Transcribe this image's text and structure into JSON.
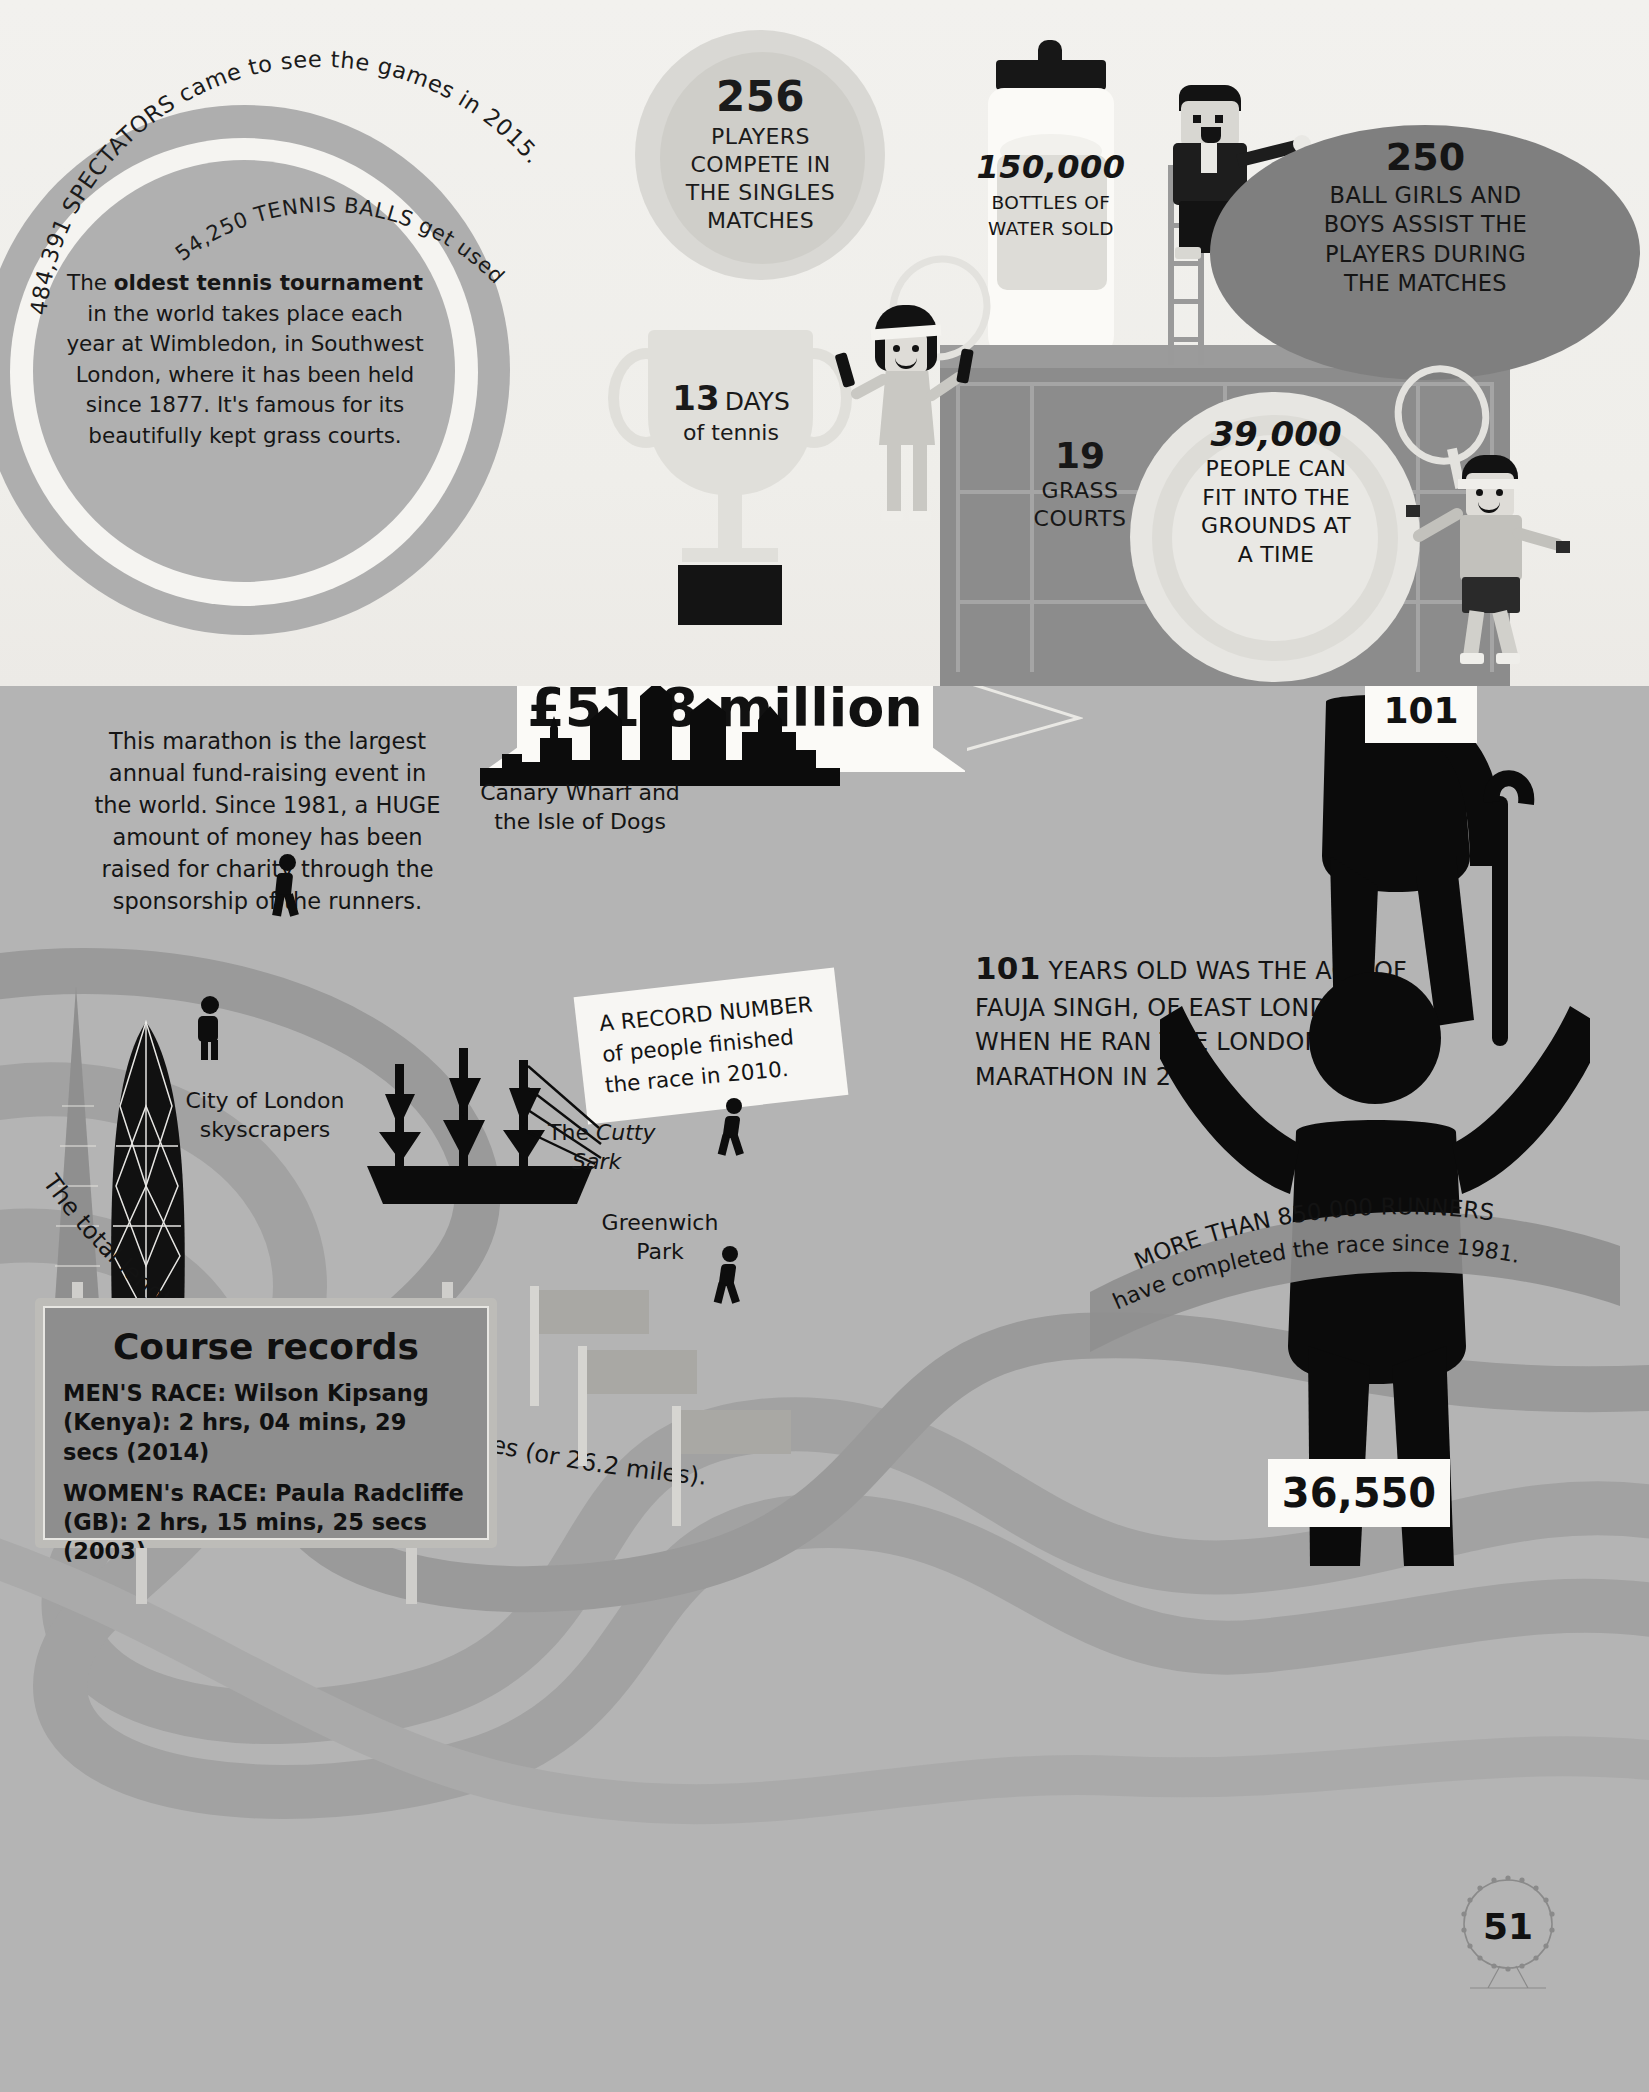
{
  "page": {
    "number": "51"
  },
  "tennis": {
    "arc_outer": "484,391 SPECTATORS came to see the games in 2015.",
    "arc_inner": "54,250 TENNIS BALLS get used during the tournament.",
    "wimbledon_intro": "The ",
    "wimbledon_bold": "oldest tennis tournament",
    "wimbledon_rest": " in the world takes place each year at Wimbledon, in Southwest London, where it has been held since 1877. It's famous for its beautifully kept grass courts.",
    "players": {
      "number": "256",
      "line1": "PLAYERS",
      "line2": "COMPETE IN",
      "line3": "THE SINGLES",
      "line4": "MATCHES"
    },
    "days": {
      "number": "13",
      "unit": "DAYS",
      "sub": "of tennis"
    },
    "bottles": {
      "number": "150,000",
      "line1": "BOTTLES OF",
      "line2": "WATER SOLD"
    },
    "ballkids": {
      "number": "250",
      "line1": "BALL GIRLS AND",
      "line2": "BOYS ASSIST THE",
      "line3": "PLAYERS DURING",
      "line4": "THE MATCHES"
    },
    "courts": {
      "number": "19",
      "line1": "GRASS",
      "line2": "COURTS"
    },
    "capacity": {
      "number": "39,000",
      "line1": "PEOPLE CAN",
      "line2": "FIT INTO THE",
      "line3": "GROUNDS AT",
      "line4": "A TIME"
    }
  },
  "marathon": {
    "intro": "This marathon is the largest annual fund-raising event in the world. Since 1981, a HUGE amount of money has been raised for charity through the sponsorship of the runners.",
    "money": "£51.8 million",
    "fauja": {
      "big": "101",
      "rest": " YEARS OLD WAS THE AGE OF FAUJA SINGH, OF EAST LONDON, WHEN HE RAN THE LONDON MARATHON IN 2012."
    },
    "bib_old": "101",
    "bib_new": "36,550",
    "record_banner": {
      "line1": "A RECORD NUMBER",
      "line2": "of people finished",
      "line3": "the race in 2010."
    },
    "route_length": "The total length of the route is 42.2 kilometres (or 26.2 miles).",
    "runners_total": "MORE THAN 850,000 RUNNERS have completed the race since 1981.",
    "landmarks": {
      "city": "City of London\nskyscrapers",
      "city_l1": "City of London",
      "city_l2": "skyscrapers",
      "canary_l1": "Canary Wharf and",
      "canary_l2": "the Isle of Dogs",
      "cutty_l1": "The ",
      "cutty_l2": "Cutty",
      "cutty_l3": "Sark",
      "greenwich_l1": "Greenwich",
      "greenwich_l2": "Park"
    },
    "course_records": {
      "title": "Course records",
      "men": "MEN'S RACE: Wilson Kipsang (Kenya): 2 hrs, 04 mins, 29 secs (2014)",
      "women": "WOMEN's RACE: Paula Radcliffe (GB): 2 hrs, 15 mins, 25 secs (2003)"
    }
  },
  "colors": {
    "tennis_bg": "#f1f0ec",
    "marathon_bg": "#b4b4b4",
    "ink": "#141414",
    "paper": "#fbfaf7",
    "mid_grey": "#8c8c8c",
    "dark_ellipse": "#7f7f7f"
  }
}
